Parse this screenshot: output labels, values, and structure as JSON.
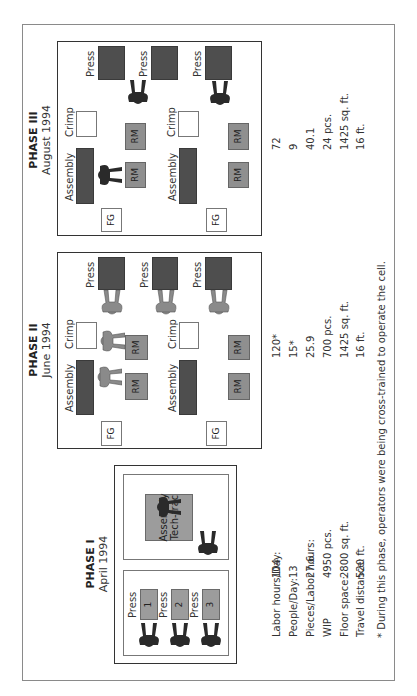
{
  "phases": [
    {
      "title": "PHASE I",
      "date": "April 1994",
      "machines": {
        "press_label": "Press",
        "presses": [
          "1",
          "2",
          "3"
        ],
        "assembly": "Assembly Tech-trac"
      },
      "stats": {
        "labor_hours_per_day": "104",
        "people_per_day": "13",
        "pieces_per_labor_hour": "27.6",
        "wip": "4950 pcs.",
        "floor_space": "2800 sq. ft.",
        "travel_distance": "520 ft."
      }
    },
    {
      "title": "PHASE II",
      "date": "June 1994",
      "machines": {
        "press_label": "Press",
        "presses": [
          "1",
          "2",
          "3"
        ],
        "crimp": "Crimp",
        "assembly": "Assembly",
        "rm": "RM",
        "fg": "FG"
      },
      "stats": {
        "labor_hours_per_day": "120*",
        "people_per_day": "15*",
        "pieces_per_labor_hour": "25.9",
        "wip": "700 pcs.",
        "floor_space": "1425 sq. ft.",
        "travel_distance": "16 ft."
      }
    },
    {
      "title": "PHASE III",
      "date": "August 1994",
      "machines": {
        "press_label": "Press",
        "presses": [
          "1",
          "2",
          "3"
        ],
        "crimp": "Crimp",
        "assembly": "Assembly",
        "rm": "RM",
        "fg": "FG"
      },
      "stats": {
        "labor_hours_per_day": "72",
        "people_per_day": "9",
        "pieces_per_labor_hour": "40.1",
        "wip": "24 pcs.",
        "floor_space": "1425 sq. ft.",
        "travel_distance": "16 ft."
      }
    }
  ],
  "stat_labels": {
    "labor_hours_per_day": "Labor hours/Day:",
    "people_per_day": "People/Day:",
    "pieces_per_labor_hour": "Pieces/Labor hours:",
    "wip": "WIP",
    "floor_space": "Floor space:",
    "travel_distance": "Travel distance:"
  },
  "footnote": "* During this phase, operators were being cross-trained to operate the cell.",
  "colors": {
    "machine_dark": "#4e4e4e",
    "raw_material": "#8f8f8f",
    "phase1_machine": "#9c9c9c",
    "operator_full_time": "#2a2a2a",
    "operator_training": "#8a8a8a"
  }
}
